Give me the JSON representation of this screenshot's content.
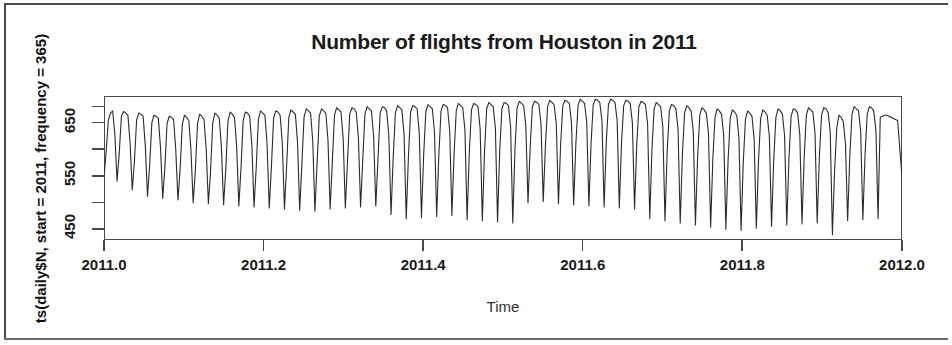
{
  "chart_data": {
    "type": "line",
    "title": "Number of flights from Houston in 2011",
    "xlabel": "Time",
    "ylabel": "ts(daily$N, start = 2011, frequency = 365)",
    "grid": false,
    "legend": null,
    "xlim": [
      2011.0,
      2012.0
    ],
    "ylim": [
      430,
      700
    ],
    "xticks": [
      "2011.0",
      "2011.2",
      "2011.4",
      "2011.6",
      "2011.8",
      "2012.0"
    ],
    "xtick_values": [
      2011.0,
      2011.2,
      2011.4,
      2011.6,
      2011.8,
      2012.0
    ],
    "yticks": [
      "450",
      "550",
      "650"
    ],
    "ytick_values": [
      450,
      550,
      650
    ],
    "yminor_ticks": [
      500,
      600,
      680
    ],
    "series_name": "daily$N",
    "frequency": 365,
    "start_year": 2011,
    "values": [
      548,
      596,
      655,
      668,
      672,
      628,
      540,
      592,
      662,
      671,
      668,
      664,
      612,
      524,
      578,
      655,
      668,
      666,
      662,
      606,
      512,
      570,
      650,
      664,
      662,
      658,
      602,
      508,
      566,
      648,
      662,
      660,
      656,
      600,
      505,
      562,
      646,
      664,
      660,
      654,
      598,
      500,
      560,
      648,
      666,
      662,
      656,
      600,
      498,
      558,
      650,
      668,
      664,
      658,
      604,
      496,
      562,
      652,
      670,
      666,
      660,
      606,
      494,
      564,
      654,
      670,
      668,
      662,
      608,
      492,
      566,
      656,
      672,
      668,
      664,
      610,
      490,
      568,
      658,
      672,
      670,
      664,
      612,
      488,
      570,
      660,
      674,
      670,
      666,
      614,
      486,
      572,
      660,
      676,
      672,
      668,
      616,
      484,
      574,
      662,
      676,
      672,
      668,
      618,
      488,
      576,
      664,
      678,
      674,
      670,
      620,
      490,
      578,
      666,
      678,
      676,
      670,
      622,
      492,
      580,
      666,
      680,
      676,
      672,
      624,
      494,
      582,
      668,
      680,
      678,
      672,
      626,
      478,
      584,
      668,
      682,
      678,
      674,
      628,
      470,
      586,
      670,
      682,
      680,
      676,
      630,
      472,
      588,
      670,
      684,
      680,
      676,
      632,
      474,
      590,
      672,
      684,
      682,
      678,
      634,
      476,
      592,
      672,
      686,
      682,
      678,
      636,
      468,
      594,
      674,
      686,
      684,
      680,
      638,
      466,
      596,
      676,
      688,
      684,
      680,
      640,
      464,
      598,
      676,
      688,
      686,
      682,
      642,
      462,
      600,
      678,
      690,
      686,
      682,
      644,
      500,
      604,
      680,
      690,
      688,
      684,
      646,
      502,
      606,
      680,
      692,
      688,
      684,
      648,
      498,
      608,
      682,
      692,
      690,
      686,
      650,
      496,
      610,
      682,
      694,
      690,
      686,
      652,
      494,
      612,
      684,
      694,
      692,
      688,
      654,
      492,
      614,
      684,
      694,
      692,
      688,
      654,
      490,
      612,
      682,
      692,
      690,
      686,
      650,
      488,
      608,
      680,
      690,
      688,
      684,
      648,
      470,
      600,
      676,
      688,
      684,
      680,
      642,
      466,
      596,
      672,
      684,
      682,
      676,
      638,
      462,
      590,
      668,
      682,
      678,
      672,
      634,
      458,
      586,
      664,
      678,
      674,
      668,
      630,
      454,
      582,
      660,
      676,
      672,
      666,
      626,
      450,
      578,
      658,
      674,
      670,
      664,
      622,
      448,
      576,
      656,
      672,
      668,
      662,
      620,
      452,
      578,
      658,
      674,
      670,
      664,
      624,
      456,
      580,
      660,
      676,
      672,
      666,
      626,
      458,
      582,
      662,
      676,
      674,
      668,
      628,
      460,
      584,
      664,
      678,
      674,
      670,
      630,
      462,
      586,
      664,
      678,
      676,
      670,
      632,
      440,
      560,
      640,
      664,
      660,
      652,
      610,
      466,
      588,
      666,
      680,
      676,
      672,
      634,
      468,
      590,
      666,
      680,
      678,
      672,
      636,
      470,
      660,
      662,
      664,
      664,
      662,
      660,
      658,
      656,
      654,
      600,
      548
    ]
  }
}
